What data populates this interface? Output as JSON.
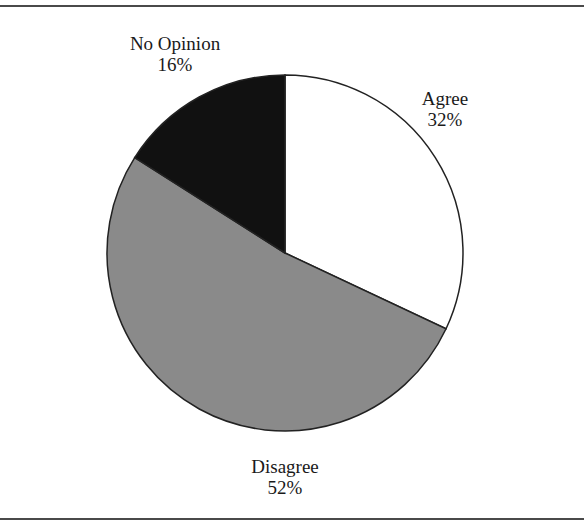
{
  "chart_data": {
    "type": "pie",
    "title": "",
    "slices": [
      {
        "label": "Agree",
        "value": 32,
        "display": "32%",
        "color": "#ffffff"
      },
      {
        "label": "Disagree",
        "value": 52,
        "display": "52%",
        "color": "#8a8a8a"
      },
      {
        "label": "No Opinion",
        "value": 16,
        "display": "16%",
        "color": "#111111"
      }
    ],
    "start_angle_deg": 0,
    "direction": "clockwise",
    "legend": "none",
    "labels_position": "outside"
  },
  "labels": {
    "agree": {
      "name": "Agree",
      "pct": "32%"
    },
    "disagree": {
      "name": "Disagree",
      "pct": "52%"
    },
    "no_opinion": {
      "name": "No Opinion",
      "pct": "16%"
    }
  }
}
